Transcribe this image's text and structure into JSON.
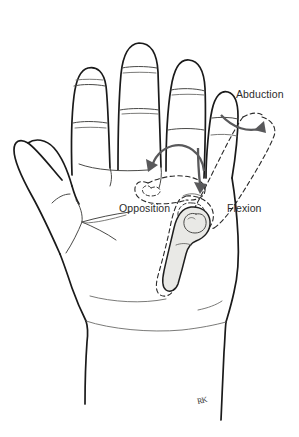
{
  "figure": {
    "background_color": "#ffffff",
    "ink_color": "#1a1a1a",
    "bone_fill_color": "#e9e9e6",
    "arrow_color": "#59595b",
    "ghost_stroke_color": "#2a2a2a"
  },
  "labels": {
    "abduction": "Abduction",
    "opposition": "Opposition",
    "flexion": "Flexion"
  },
  "signature": {
    "text": "RK"
  },
  "annotations": [
    {
      "name": "abduction",
      "label": "Abduction",
      "arrow": "curved-arc-right",
      "description": "arc from thumb resting position sweeping right to dashed abducted thumb"
    },
    {
      "name": "opposition",
      "label": "Opposition",
      "arrow": "curved-arc-left",
      "description": "arc sweeping left across the palm toward the dashed opposed thumb outline"
    },
    {
      "name": "flexion",
      "label": "Flexion",
      "arrow": "straight-down",
      "description": "straight arrow pointing downward at the carpometacarpal joint"
    }
  ],
  "anatomy": {
    "digits": [
      "index finger",
      "middle finger",
      "ring finger",
      "little finger"
    ],
    "thumb": "thumb",
    "bone_highlighted": "first metacarpal",
    "joint_highlighted": "carpometacarpal joint",
    "palm": "palm",
    "wrist": "wrist"
  }
}
